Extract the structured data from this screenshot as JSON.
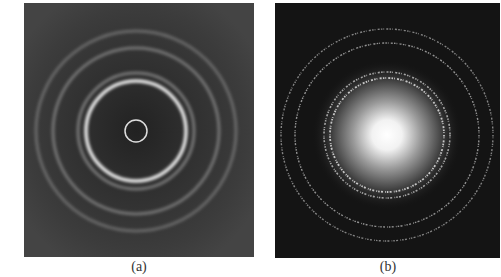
{
  "figure": {
    "panels": [
      {
        "id": "a",
        "caption": "(a)",
        "description": "Diffraction ring pattern on gray background with small bright central ring, one strong bright ring and several faint diffuse outer rings",
        "background": "#3a3a3a",
        "center": [
          112,
          128
        ],
        "rings": [
          {
            "r": 11,
            "color": "#e8e8e8",
            "width": 1.5,
            "opacity": 0.95
          },
          {
            "r": 50,
            "color": "#f4f4f4",
            "width": 3.5,
            "opacity": 0.95
          },
          {
            "r": 58,
            "color": "#bdbdbd",
            "width": 3,
            "opacity": 0.5
          },
          {
            "r": 83,
            "color": "#a8a8a8",
            "width": 3,
            "opacity": 0.55
          },
          {
            "r": 100,
            "color": "#9a9a9a",
            "width": 3,
            "opacity": 0.5
          }
        ]
      },
      {
        "id": "b",
        "caption": "(b)",
        "description": "Electron diffraction pattern with bright central glow and spotty concentric rings on dark background",
        "background": "#141414",
        "center": [
          112,
          132
        ],
        "glow_radius": 75,
        "rings": [
          {
            "r": 57,
            "color": "#e0e0e0",
            "width": 1.8,
            "opacity": 0.85
          },
          {
            "r": 63,
            "color": "#d0d0d0",
            "width": 1.6,
            "opacity": 0.75
          },
          {
            "r": 92,
            "color": "#c8c8c8",
            "width": 1.4,
            "opacity": 0.7
          },
          {
            "r": 106,
            "color": "#c0c0c0",
            "width": 1.4,
            "opacity": 0.65
          }
        ]
      }
    ]
  }
}
